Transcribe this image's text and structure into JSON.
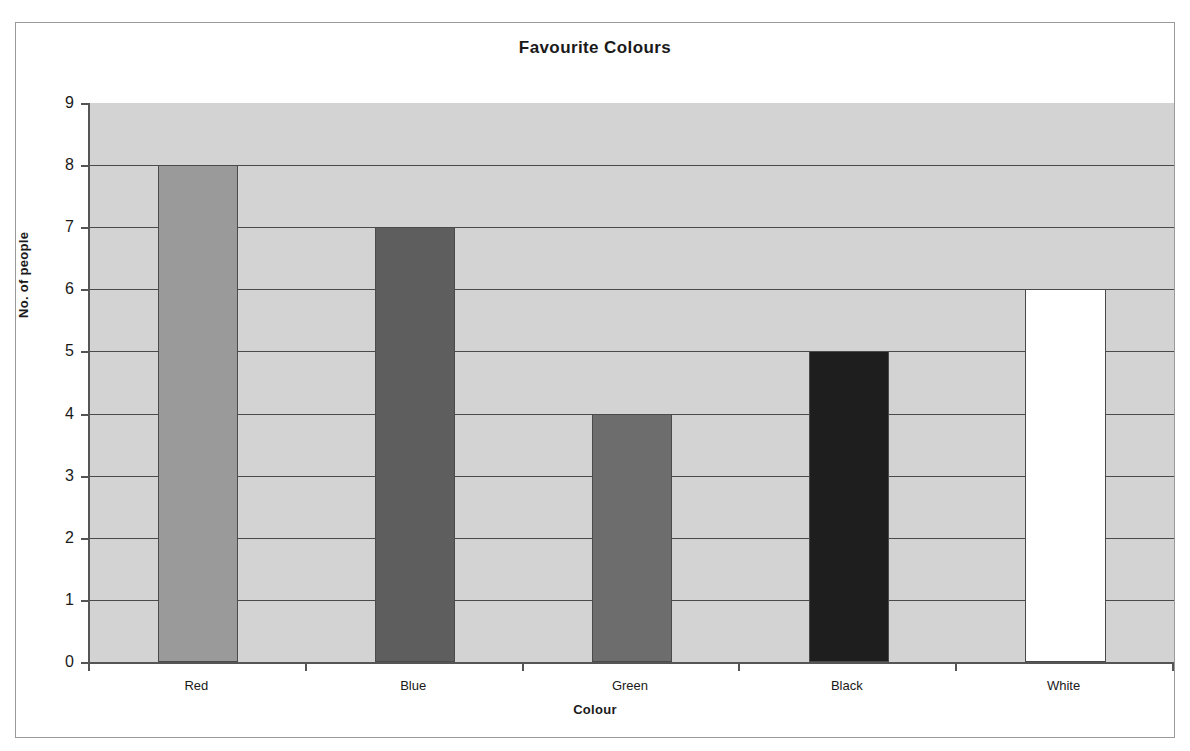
{
  "chart_data": {
    "type": "bar",
    "title": "Favourite Colours",
    "xlabel": "Colour",
    "ylabel": "No. of people",
    "categories": [
      "Red",
      "Blue",
      "Green",
      "Black",
      "White"
    ],
    "values": [
      8,
      7,
      4,
      5,
      6
    ],
    "ylim": [
      0,
      9
    ],
    "ytick_labels": [
      "0",
      "1",
      "2",
      "3",
      "4",
      "5",
      "6",
      "7",
      "8",
      "9"
    ],
    "ytick_values": [
      0,
      1,
      2,
      3,
      4,
      5,
      6,
      7,
      8,
      9
    ],
    "grid": true,
    "grid_axis": "y",
    "legend": false,
    "bar_colors": [
      "#9a9a9a",
      "#5e5e5e",
      "#6d6d6d",
      "#1e1e1e",
      "#ffffff"
    ],
    "bar_border_color": "#4a4a4a",
    "plot_background": "#d3d3d3",
    "figure_background": "#ffffff",
    "axis_color": "#555555",
    "gridline_color": "#4a4a4a",
    "text_color": "#1a1a1a",
    "bar_width_fraction": 0.37
  }
}
